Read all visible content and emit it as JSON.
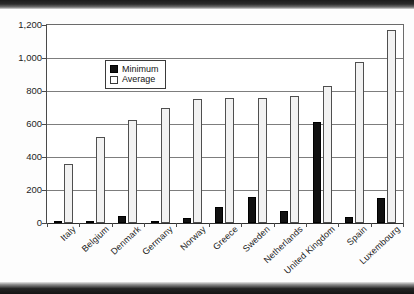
{
  "chart_data": {
    "type": "bar",
    "title": "",
    "subtitle": "",
    "xlabel": "",
    "ylabel": "",
    "ylim": [
      0,
      1200
    ],
    "ytick_step": 200,
    "yticks": [
      "0",
      "200",
      "400",
      "600",
      "800",
      "1,000",
      "1,200"
    ],
    "grid": true,
    "legend_position": "top-left-inside",
    "categories": [
      "Italy",
      "Belgium",
      "Denmark",
      "Germany",
      "Norway",
      "Greece",
      "Sweden",
      "Netherlands",
      "United Kingdom",
      "Spain",
      "Luxembourg"
    ],
    "series": [
      {
        "name": "Minimum",
        "color": "#111111",
        "values": [
          15,
          10,
          45,
          15,
          30,
          95,
          160,
          75,
          615,
          35,
          150
        ]
      },
      {
        "name": "Average",
        "color": "#f2f2f2",
        "values": [
          355,
          520,
          625,
          700,
          750,
          755,
          755,
          770,
          830,
          975,
          1170
        ]
      }
    ]
  },
  "legend": {
    "items": [
      {
        "label": "Minimum",
        "swatch": "filled-black-square-icon"
      },
      {
        "label": "Average",
        "swatch": "hollow-white-square-icon"
      }
    ]
  }
}
